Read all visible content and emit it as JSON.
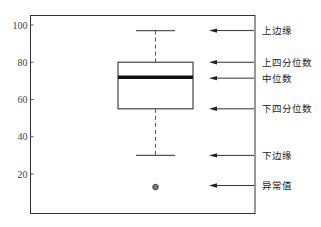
{
  "chart_data": {
    "type": "box",
    "title": "",
    "xlabel": "",
    "ylabel": "",
    "ylim": [
      2,
      106
    ],
    "yticks": [
      20,
      40,
      60,
      80,
      100
    ],
    "ytick_labels": [
      "20",
      "40",
      "60",
      "80",
      "100"
    ],
    "grid": false,
    "box": {
      "upper_whisker": 97,
      "q3": 80,
      "median": 72,
      "q1": 55,
      "lower_whisker": 30,
      "outliers": [
        13
      ]
    },
    "annotations": [
      {
        "label": "上边缘",
        "target": "upper_whisker"
      },
      {
        "label": "上四分位数",
        "target": "q3"
      },
      {
        "label": "中位数",
        "target": "median"
      },
      {
        "label": "下四分位数",
        "target": "q1"
      },
      {
        "label": "下边缘",
        "target": "lower_whisker"
      },
      {
        "label": "异常值",
        "target": "outlier"
      }
    ]
  }
}
